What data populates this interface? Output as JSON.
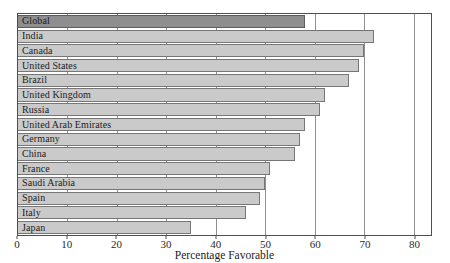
{
  "figure": {
    "colors": {
      "bar_fill": "#cacaca",
      "bar_border": "#767676",
      "highlight_fill": "#8e8e8e",
      "highlight_border": "#5c5c5c",
      "plot_border": "#4f4f4f",
      "gridline": "#8f8f8f",
      "text": "#1c1c1c",
      "background": "#ffffff"
    }
  },
  "chart_data": {
    "type": "bar",
    "orientation": "horizontal",
    "title": "",
    "xlabel": "Percentage Favorable",
    "ylabel": "",
    "categories": [
      "Global",
      "India",
      "Canada",
      "United States",
      "Brazil",
      "United Kingdom",
      "Russia",
      "United Arab Emirates",
      "Germany",
      "China",
      "France",
      "Saudi Arabia",
      "Spain",
      "Italy",
      "Japan"
    ],
    "values": [
      58,
      72,
      70,
      69,
      67,
      62,
      61,
      58,
      57,
      56,
      51,
      50,
      49,
      46,
      35
    ],
    "highlight_category": "Global",
    "xticks": [
      0,
      10,
      20,
      30,
      40,
      50,
      60,
      70,
      80
    ],
    "xlim": [
      0,
      83.5
    ],
    "grid": true,
    "legend": "none"
  }
}
